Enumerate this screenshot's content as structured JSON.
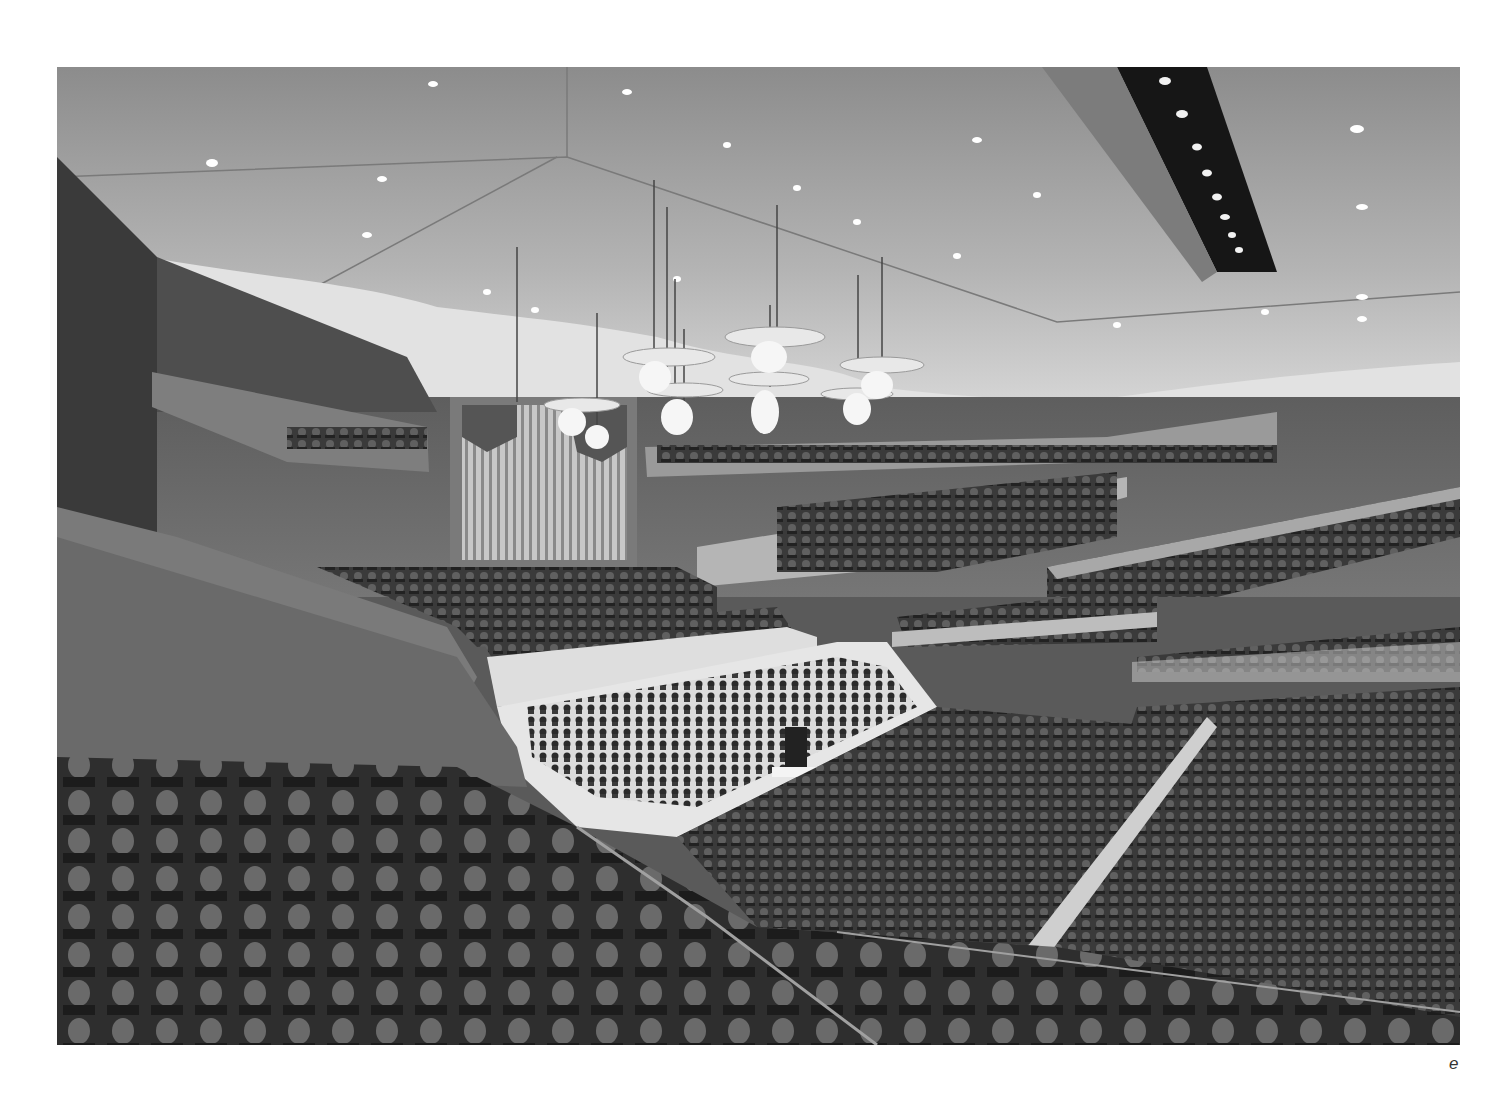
{
  "figure": {
    "style": "grayscale architectural rendering",
    "elements": [
      "ceiling-downlights",
      "ceiling-skylight-slot",
      "chandeliers",
      "pipe-organ",
      "balconies",
      "stage",
      "orchestra",
      "conductor",
      "audience-seating"
    ],
    "colors": {
      "ceiling": "#a9a9a9",
      "walls": "#6e6e6e",
      "stage": "#e6e6e6",
      "audience": "#3c3c3c",
      "slot": "#161616",
      "light": "#ffffff"
    }
  },
  "caption": {
    "label": "e"
  }
}
